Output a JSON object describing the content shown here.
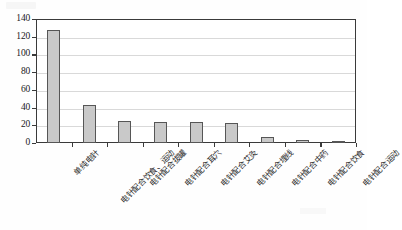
{
  "chart_data": {
    "type": "bar",
    "title": "",
    "xlabel": "",
    "ylabel": "",
    "ylim": [
      0,
      140
    ],
    "ytick_step": 20,
    "grid": true,
    "legend": false,
    "categories": [
      "单纯电针",
      "电针配合饮食、运动",
      "电针配合拔罐",
      "电针配合耳穴",
      "电针配合艾灸",
      "电针配合埋线",
      "电针配合中药",
      "电针配合饮食",
      "电针配合运动"
    ],
    "values": [
      128,
      43,
      25,
      24,
      24,
      23,
      7,
      3,
      1
    ],
    "yticks": [
      "0",
      "20",
      "40",
      "60",
      "80",
      "100",
      "120",
      "140"
    ],
    "bar_fill": "#c9c9c9",
    "bar_edge": "#565656",
    "grid_color": "#d9d9d9",
    "axis_color": "#3a3a3a"
  }
}
